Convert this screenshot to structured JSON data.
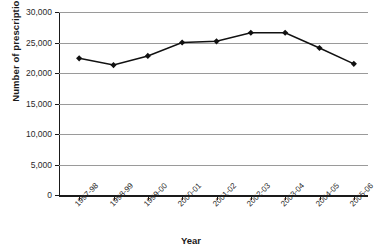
{
  "chart_data": {
    "type": "line",
    "title": "",
    "xlabel": "Year",
    "ylabel": "Number of prescriptions",
    "categories": [
      "1997-98",
      "1998-99",
      "1999-00",
      "2000-01",
      "2001-02",
      "2002-03",
      "2003-04",
      "2004-05",
      "2005-06"
    ],
    "values": [
      22400,
      21300,
      22800,
      25000,
      25200,
      26600,
      26600,
      24100,
      21500
    ],
    "series": [
      {
        "name": "Number of prescriptions",
        "values": [
          22400,
          21300,
          22800,
          25000,
          25200,
          26600,
          26600,
          24100,
          21500
        ]
      }
    ],
    "ylim": [
      0,
      30000
    ],
    "ytick_labels": [
      "0",
      "5,000",
      "10,000",
      "15,000",
      "20,000",
      "25,000",
      "30,000"
    ],
    "ytick_values": [
      0,
      5000,
      10000,
      15000,
      20000,
      25000,
      30000
    ],
    "grid": true,
    "legend": "none",
    "marker": "diamond",
    "line_color": "#111111",
    "grid_color": "#9a9a9a"
  }
}
